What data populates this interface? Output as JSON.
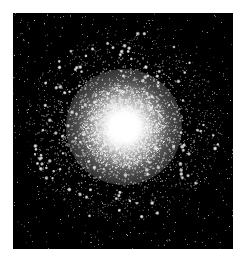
{
  "image": {
    "kind": "astronomical-photograph",
    "subject": "globular star cluster",
    "palette": "grayscale",
    "page_background": "#ffffff",
    "plate_background": "#000000",
    "core_color": "#ffffff",
    "star_color": "#f2f2f2",
    "alt_text": "Black-and-white astronomical photograph of a globular star cluster: thousands of pinpoint stars densely concentrated toward a saturated white core, thinning into a sparse black sky toward the edges."
  },
  "plate": {
    "x": 13,
    "y": 13,
    "width": 220,
    "height": 236
  },
  "cluster": {
    "center_x": 111,
    "center_y": 114,
    "core_radius": 19,
    "halo_radius": 34,
    "outskirt_radius": 96,
    "glow_radius": 58,
    "star_count": 5200,
    "concentration": 2.45,
    "min_star_size": 0.55,
    "max_star_size": 1.85,
    "seed": 20240517
  },
  "rendering": {
    "field_star_count": 620,
    "core_glow_opacity": 0.95,
    "halo_glow_opacity": 0.38,
    "background_noise_opacity": 0.1
  }
}
